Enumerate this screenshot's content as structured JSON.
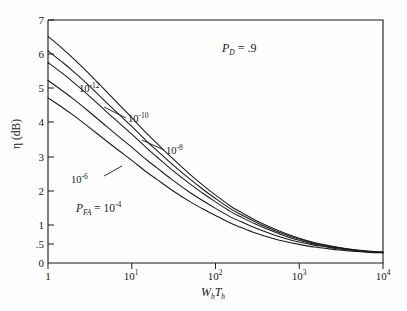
{
  "chart_data": {
    "type": "line",
    "title": "",
    "xlabel": "W_h T_h",
    "ylabel": "η (dB)",
    "xscale": "log",
    "xlim": [
      1,
      10000
    ],
    "ylim": [
      0,
      7
    ],
    "grid": false,
    "legend_position": "inline-annotations",
    "x_tick_labels": [
      "1",
      "10¹",
      "10²",
      "10³",
      "10⁴"
    ],
    "x_tick_values": [
      1,
      10,
      100,
      1000,
      10000
    ],
    "y_tick_labels": [
      "0",
      ".5",
      "1",
      "2",
      "3",
      "4",
      "5",
      "6",
      "7"
    ],
    "y_tick_values": [
      0,
      0.5,
      1,
      2,
      3,
      4,
      5,
      6,
      7
    ],
    "annotations": [
      {
        "text": "P_D = .9",
        "x": 120,
        "y": 6.35
      },
      {
        "text": "10^-12",
        "x": 3.2,
        "y": 5.2
      },
      {
        "text": "10^-10",
        "x": 11,
        "y": 4.35
      },
      {
        "text": "10^-8",
        "x": 33,
        "y": 3.45
      },
      {
        "text": "10^-6",
        "x": 2.3,
        "y": 2.78
      },
      {
        "text": "P_FA = 10^-4",
        "x": 2.6,
        "y": 1.95
      }
    ],
    "x": [
      1,
      1.5,
      2,
      3,
      5,
      7,
      10,
      15,
      20,
      30,
      50,
      70,
      100,
      150,
      200,
      300,
      500,
      700,
      1000,
      1500,
      2000,
      3000,
      5000,
      7000,
      10000
    ],
    "series": [
      {
        "name": "10^-12",
        "label": "10⁻¹²",
        "values": [
          6.55,
          6.18,
          5.9,
          5.48,
          4.92,
          4.55,
          4.16,
          3.7,
          3.4,
          2.98,
          2.48,
          2.18,
          1.88,
          1.56,
          1.38,
          1.14,
          0.9,
          0.77,
          0.65,
          0.54,
          0.48,
          0.41,
          0.34,
          0.31,
          0.29
        ]
      },
      {
        "name": "10^-10",
        "label": "10⁻¹⁰",
        "values": [
          6.12,
          5.78,
          5.52,
          5.13,
          4.6,
          4.26,
          3.9,
          3.47,
          3.19,
          2.8,
          2.34,
          2.06,
          1.78,
          1.48,
          1.31,
          1.09,
          0.86,
          0.74,
          0.63,
          0.52,
          0.47,
          0.4,
          0.33,
          0.3,
          0.28
        ]
      },
      {
        "name": "10^-8",
        "label": "10⁻⁸",
        "values": [
          5.78,
          5.45,
          5.2,
          4.83,
          4.33,
          4.01,
          3.67,
          3.27,
          3.0,
          2.63,
          2.2,
          1.94,
          1.68,
          1.4,
          1.24,
          1.03,
          0.82,
          0.7,
          0.6,
          0.5,
          0.45,
          0.39,
          0.32,
          0.29,
          0.28
        ]
      },
      {
        "name": "10^-6",
        "label": "10⁻⁶",
        "values": [
          5.25,
          4.94,
          4.71,
          4.36,
          3.9,
          3.6,
          3.29,
          2.92,
          2.68,
          2.34,
          1.95,
          1.72,
          1.49,
          1.24,
          1.1,
          0.92,
          0.74,
          0.64,
          0.55,
          0.47,
          0.43,
          0.37,
          0.31,
          0.29,
          0.27
        ]
      },
      {
        "name": "10^-4",
        "label": "Pₕₐ = 10⁻⁴",
        "values": [
          4.74,
          4.45,
          4.23,
          3.9,
          3.47,
          3.19,
          2.9,
          2.56,
          2.34,
          2.03,
          1.68,
          1.48,
          1.28,
          1.06,
          0.94,
          0.79,
          0.64,
          0.56,
          0.49,
          0.42,
          0.39,
          0.34,
          0.3,
          0.28,
          0.27
        ]
      }
    ]
  },
  "axis": {
    "ylabel_eta": "η",
    "ylabel_units": " (dB)",
    "xlabel_w": "W",
    "xlabel_wsub": "h",
    "xlabel_t": "T",
    "xlabel_tsub": "h",
    "y_ticks": [
      "7",
      "6",
      "5",
      "4",
      "3",
      "2",
      "1",
      ".5",
      "0"
    ],
    "x_ticks": [
      "1",
      "10",
      "10",
      "10",
      "10"
    ],
    "x_tick_exps": [
      "",
      "1",
      "2",
      "3",
      "4"
    ]
  },
  "annotations": {
    "pd_symbol": "P",
    "pd_sub": "D",
    "pd_value": " = .9",
    "label_12_base": "10",
    "label_12_exp": "-12",
    "label_10_base": "10",
    "label_10_exp": "-10",
    "label_8_base": "10",
    "label_8_exp": "-8",
    "label_6_base": "10",
    "label_6_exp": "-6",
    "label_fa_symbol": "P",
    "label_fa_sub": "FA",
    "label_fa_eq": " = 10",
    "label_fa_exp": "-4"
  },
  "style": {
    "line_color": "#1a1a1a",
    "axis_color": "#1a1a1a",
    "background": "#fdfdfd"
  }
}
